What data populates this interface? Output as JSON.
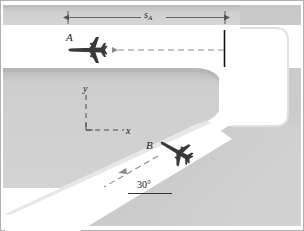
{
  "figure": {
    "labels": {
      "distance_s_a": "s",
      "distance_s_a_sub": "A",
      "plane_a": "A",
      "plane_b": "B",
      "axis_y": "y",
      "axis_x": "x",
      "angle": "30°"
    },
    "colors": {
      "ground_gray": "#c9c9c9",
      "ground_gray_light": "#d4d4d4",
      "runway_white": "#ffffff",
      "ink": "#1a1a1a",
      "dim_line": "#555555",
      "dashed": "#8a8a8a",
      "border": "#b5b5b5"
    },
    "elements": {
      "dimension_line": "s-sub-A spanning runway A from left edge to tick mark",
      "tick_mark": "vertical black reference tick at right end of runway A",
      "plane_a_heading": "left (180 degrees)",
      "plane_b_heading": "down-left at 30 degrees below horizontal",
      "coordinate_axes": "x to the right, y upward, dashed",
      "angle_reference_line": "horizontal solid line under 30° label"
    }
  }
}
